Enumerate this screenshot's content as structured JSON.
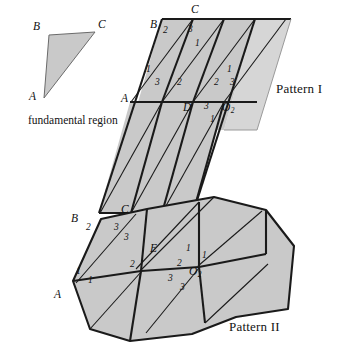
{
  "figure": {
    "title_absent": true,
    "background_color": "#ffffff",
    "fill_color": "#c9c9c9",
    "fill_color_light": "#d8d8d8",
    "stroke_color": "#1a1a1a",
    "captions": {
      "fundamental_region": "fundamental region",
      "pattern_one": "Pattern I",
      "pattern_two": "Pattern II"
    }
  },
  "fundamental_region": {
    "name": "fundamental region",
    "vertices": [
      {
        "label": "B",
        "x": 43,
        "y": 33
      },
      {
        "label": "C",
        "x": 98,
        "y": 30
      },
      {
        "label": "A",
        "x": 40,
        "y": 101
      }
    ],
    "triangle_points": "49,36 95,33 44,97",
    "label_positions": [
      {
        "label": "B",
        "x": 34,
        "y": 24
      },
      {
        "label": "C",
        "x": 98,
        "y": 22
      },
      {
        "label": "A",
        "x": 30,
        "y": 93
      }
    ]
  },
  "pattern_one": {
    "caption": "Pattern I",
    "caption_position": {
      "x": 277,
      "y": 86
    },
    "outline_points": "162,20 290,20 256,130 128,130",
    "shaded_main_points": "162,20 255,20 224,130 128,130",
    "shaded_light_points": "255,20 290,20 256,130 239,130",
    "grid_rows": 2,
    "grid_cols": 3,
    "vertex_labels": [
      {
        "label": "B",
        "x": 153,
        "y": 21
      },
      {
        "label": "C",
        "x": 192,
        "y": 8
      },
      {
        "label": "A",
        "x": 125,
        "y": 87
      },
      {
        "label": "D",
        "x": 186,
        "y": 95
      },
      {
        "label": "O",
        "x": 226,
        "y": 95,
        "subscript": "2"
      }
    ],
    "angle_numbers": [
      {
        "value": "2",
        "x": 165,
        "y": 29
      },
      {
        "value": "3",
        "x": 190,
        "y": 28
      },
      {
        "value": "1",
        "x": 196,
        "y": 42
      },
      {
        "value": "1",
        "x": 149,
        "y": 68
      },
      {
        "value": "3",
        "x": 157,
        "y": 79
      },
      {
        "value": "2",
        "x": 178,
        "y": 79
      },
      {
        "value": "2",
        "x": 216,
        "y": 79
      },
      {
        "value": "1",
        "x": 228,
        "y": 68
      },
      {
        "value": "3",
        "x": 231,
        "y": 79
      },
      {
        "value": "3",
        "x": 206,
        "y": 95
      },
      {
        "value": "1",
        "x": 212,
        "y": 108
      }
    ]
  },
  "pattern_two": {
    "caption": "Pattern II",
    "caption_position": {
      "x": 230,
      "y": 324
    },
    "outline_points": "100,218 148,208 215,196 268,209 295,245 288,310 236,318 193,335 130,342 90,330 72,281",
    "vertex_labels": [
      {
        "label": "B",
        "x": 74,
        "y": 216
      },
      {
        "label": "C",
        "x": 124,
        "y": 207
      },
      {
        "label": "E",
        "x": 154,
        "y": 246
      },
      {
        "label": "A",
        "x": 57,
        "y": 292
      },
      {
        "label": "O",
        "x": 192,
        "y": 268,
        "subscript": "2"
      }
    ],
    "angle_numbers": [
      {
        "value": "2",
        "x": 88,
        "y": 226
      },
      {
        "value": "3",
        "x": 117,
        "y": 227
      },
      {
        "value": "3",
        "x": 127,
        "y": 236
      },
      {
        "value": "1",
        "x": 79,
        "y": 270
      },
      {
        "value": "1",
        "x": 91,
        "y": 278
      },
      {
        "value": "2",
        "x": 133,
        "y": 264
      },
      {
        "value": "2",
        "x": 180,
        "y": 263
      },
      {
        "value": "1",
        "x": 189,
        "y": 248
      },
      {
        "value": "1",
        "x": 204,
        "y": 254
      },
      {
        "value": "3",
        "x": 171,
        "y": 277
      },
      {
        "value": "3",
        "x": 183,
        "y": 285
      }
    ]
  }
}
